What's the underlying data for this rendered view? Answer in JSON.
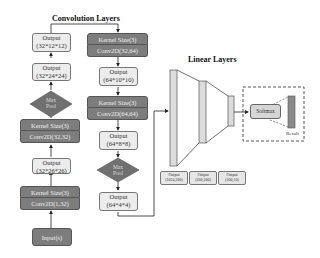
{
  "titles": {
    "convolution": "Convolution Layers",
    "linear": "Linear Layers"
  },
  "left_column": {
    "input": "Input(s)",
    "conv1": {
      "kernel": "Kernel Size(3)",
      "conv": "Conv2D(1,32)"
    },
    "out1": {
      "label": "Output",
      "shape": "(32*26*26)"
    },
    "conv2": {
      "kernel": "Kernel Size(3)",
      "conv": "Conv2D(32,32)"
    },
    "out2": {
      "label": "Output",
      "shape": "(32*24*24)"
    },
    "pool": {
      "line1": "Max",
      "line2": "Pool"
    },
    "out3": {
      "label": "Output",
      "shape": "(32*12*12)"
    }
  },
  "right_column": {
    "conv3": {
      "kernel": "Kernel Size(3)",
      "conv": "Conv2D(32,64)"
    },
    "out4": {
      "label": "Output",
      "shape": "(64*10*10)"
    },
    "conv4": {
      "kernel": "Kernel Size(3)",
      "conv": "Conv2D(64,64)"
    },
    "out5": {
      "label": "Output",
      "shape": "(64*8*8)"
    },
    "pool": {
      "line1": "Max",
      "line2": "Pool"
    },
    "out6": {
      "label": "Output",
      "shape": "(64*4*4)"
    }
  },
  "linear": {
    "outputs": [
      {
        "label": "Output",
        "shape": "(1024,200)"
      },
      {
        "label": "Output",
        "shape": "(200,200)"
      },
      {
        "label": "Output",
        "shape": "(200,10)"
      }
    ]
  },
  "head": {
    "softmax": "Softmax",
    "result": "Result"
  }
}
